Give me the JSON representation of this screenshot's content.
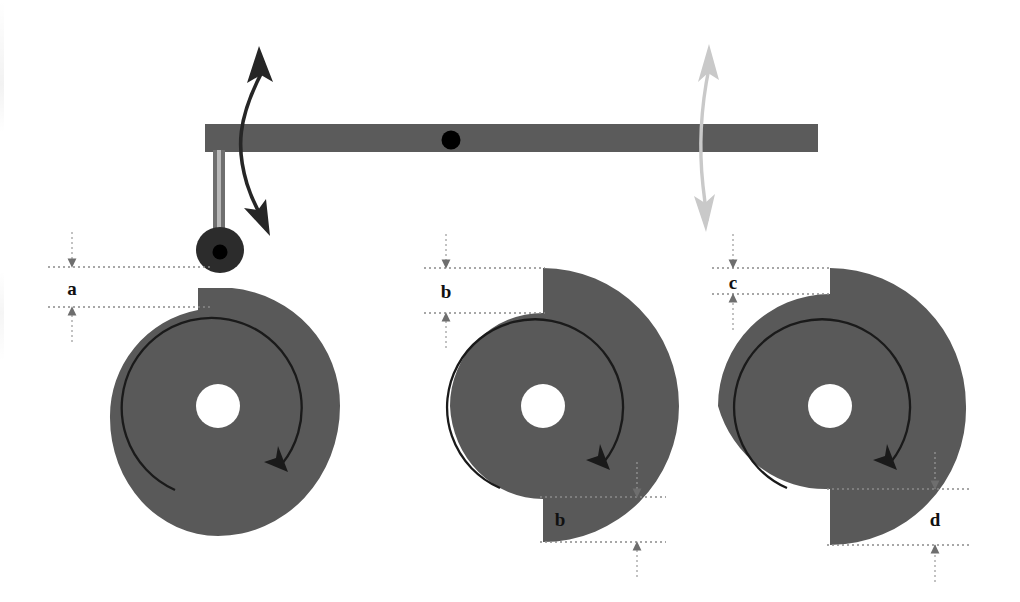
{
  "figure": {
    "type": "mechanical-diagram",
    "background_color": "#ffffff"
  },
  "colors": {
    "cam_fill": "#595959",
    "beam_fill": "#5b5b5b",
    "roller_fill": "#2a2a2a",
    "hub_fill": "#000000",
    "stem_fill": "#6f6f6f",
    "pivot_fill": "#000000",
    "dark_arrow": "#262626",
    "light_arrow": "#c9c9c9",
    "dimension_line": "#8a8a8a",
    "profile_arc": "#1a1a1a",
    "label_text": "#111111"
  },
  "lever": {
    "name": "rocker-arm",
    "pivot_label": "",
    "left_end_x": 205,
    "right_end_x": 818,
    "top_y": 124,
    "height": 28,
    "pivot_x": 451,
    "pivot_y": 140,
    "pivot_radius": 9
  },
  "follower": {
    "name": "roller-follower",
    "stem_x": 219,
    "stem_top_y": 152,
    "stem_bottom_y": 252,
    "roller_cx": 220,
    "roller_cy": 250,
    "roller_rx": 24,
    "roller_ry": 22,
    "hub_radius": 7
  },
  "motion_arrows": [
    {
      "name": "follower-stroke-arrow",
      "style": "dark",
      "color": "#262626",
      "double_headed": true,
      "top_x": 259,
      "top_y": 48,
      "bottom_x": 268,
      "bottom_y": 232
    },
    {
      "name": "lever-end-stroke-arrow",
      "style": "light",
      "color": "#c9c9c9",
      "double_headed": true,
      "top_x": 709,
      "top_y": 46,
      "bottom_x": 706,
      "bottom_y": 230
    }
  ],
  "cams": [
    {
      "id": "cam-left",
      "name": "cam-single-lobe",
      "center_x": 218,
      "center_y": 406,
      "bore_radius": 22,
      "base_radius": 118,
      "rise_radius": 140,
      "lobes": 1,
      "rotation": "clockwise",
      "rotation_arrow_label": "clockwise rotation",
      "notch_count": 1,
      "dimensions": [
        {
          "label": "a",
          "name": "dimension-a",
          "position": "top-left",
          "label_x": 72,
          "label_y": 292,
          "upper_y": 267,
          "lower_y": 307,
          "ext_left_x": 48,
          "ext_right_x": 212,
          "arrow_x": 72
        }
      ]
    },
    {
      "id": "cam-middle",
      "name": "cam-double-lobe",
      "center_x": 543,
      "center_y": 406,
      "bore_radius": 22,
      "base_radius": 96,
      "rise_radius": 140,
      "lobes": 2,
      "rotation": "clockwise",
      "rotation_arrow_label": "clockwise rotation",
      "notch_count": 2,
      "dimensions": [
        {
          "label": "b",
          "name": "dimension-b-top",
          "position": "top-left",
          "label_x": 446,
          "label_y": 295,
          "upper_y": 268,
          "lower_y": 313,
          "ext_left_x": 424,
          "ext_right_x": 540,
          "arrow_x": 446
        },
        {
          "label": "b",
          "name": "dimension-b-bottom",
          "position": "bottom-right",
          "label_x": 560,
          "label_y": 523,
          "upper_y": 497,
          "lower_y": 542,
          "ext_left_x": 540,
          "ext_right_x": 660,
          "arrow_x": 637
        }
      ]
    },
    {
      "id": "cam-right",
      "name": "cam-asymmetric-lobe",
      "center_x": 830,
      "center_y": 406,
      "bore_radius": 22,
      "base_radius": 96,
      "rise_radius": 140,
      "lobes": 2,
      "rotation": "clockwise",
      "rotation_arrow_label": "clockwise rotation",
      "notch_count": 2,
      "dimensions": [
        {
          "label": "c",
          "name": "dimension-c-top",
          "position": "top-left",
          "label_x": 733,
          "label_y": 288,
          "upper_y": 268,
          "lower_y": 294,
          "ext_left_x": 712,
          "ext_right_x": 827,
          "arrow_x": 733
        },
        {
          "label": "d",
          "name": "dimension-d-bottom",
          "position": "bottom-right",
          "label_x": 935,
          "label_y": 523,
          "upper_y": 489,
          "lower_y": 545,
          "ext_left_x": 827,
          "ext_right_x": 965,
          "arrow_x": 935
        }
      ]
    }
  ]
}
